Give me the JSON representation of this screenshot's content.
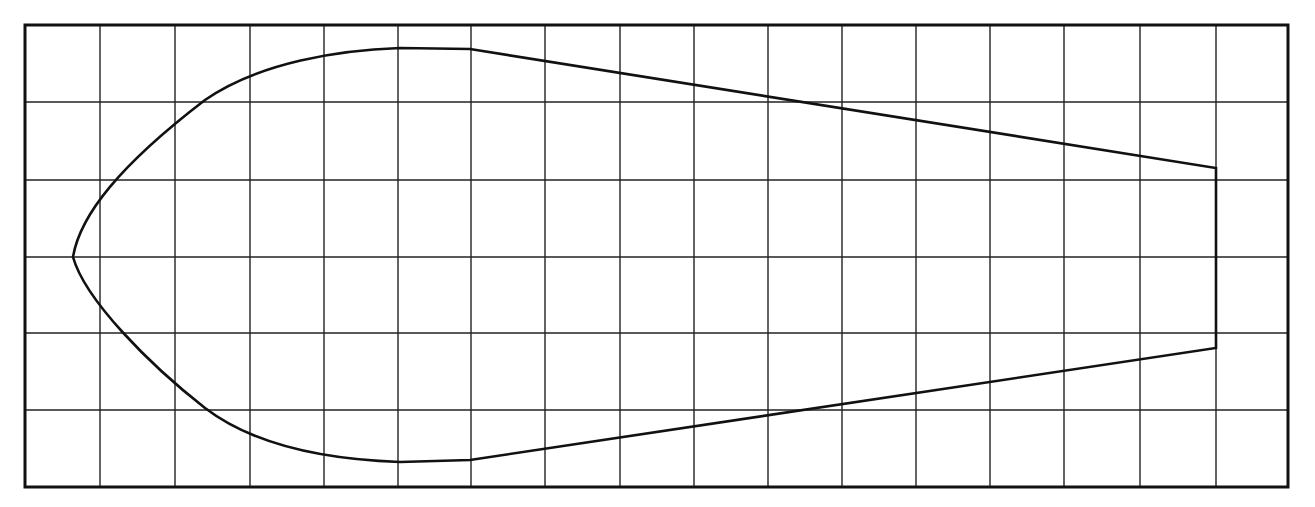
{
  "diagram": {
    "type": "grid-outline-shape",
    "colors": {
      "background": "#ffffff",
      "stroke": "#111111",
      "grid": "#222222"
    },
    "frame": {
      "x1": 25,
      "y1": 25,
      "x2": 1288,
      "y2": 487,
      "stroke_width": 3
    },
    "grid": {
      "vertical_lines": [
        100,
        175,
        250,
        324,
        398,
        471,
        545,
        620,
        694,
        768,
        842,
        916,
        990,
        1064,
        1140,
        1216
      ],
      "horizontal_lines": [
        102,
        180,
        257,
        333,
        410
      ],
      "stroke_width": 1.4
    },
    "shape": {
      "stroke_width": 2.6,
      "path": "M 73 257 C 80 215, 120 165, 205 100 C 260 62, 340 50, 400 48 L 470 49 L 1216 168 L 1216 348 L 470 460 L 400 462 C 340 460, 260 450, 205 408 C 150 365, 85 300, 73 257 Z",
      "key_points": [
        {
          "label": "nose",
          "x": 73,
          "y": 257
        },
        {
          "label": "top-crest",
          "x": 435,
          "y": 48
        },
        {
          "label": "top-right-corner",
          "x": 1216,
          "y": 168
        },
        {
          "label": "bottom-right-corner",
          "x": 1216,
          "y": 348
        },
        {
          "label": "bottom-trough",
          "x": 435,
          "y": 461
        }
      ]
    }
  }
}
